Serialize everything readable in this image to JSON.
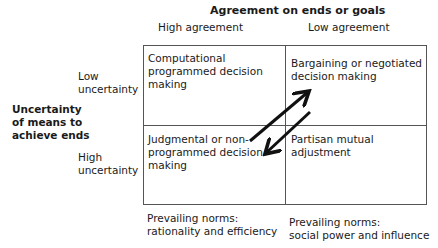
{
  "title": "Agreement on ends or goals",
  "columns": [
    {
      "label": "High agreement"
    },
    {
      "label": "Low agreement"
    }
  ],
  "row_axis_label": [
    "Uncertainty",
    "of means to",
    "achieve ends"
  ],
  "rows": [
    {
      "label": [
        "Low",
        "uncertainty"
      ]
    },
    {
      "label": [
        "High",
        "uncertainty"
      ]
    }
  ],
  "cells": {
    "top_left": [
      "Computational",
      "programmed decision",
      "making"
    ],
    "top_right": [
      "Bargaining or negotiated",
      "decision making"
    ],
    "bottom_left": [
      "Judgmental or non-",
      "programmed decision",
      "making"
    ],
    "bottom_right": [
      "Partisan mutual",
      "adjustment"
    ]
  },
  "norms": {
    "left": [
      "Prevailing norms:",
      "rationality and efficiency"
    ],
    "right": [
      "Prevailing norms:",
      "social power and influence"
    ]
  },
  "arrows": [
    {
      "name": "to-bargaining",
      "direction": "up-right"
    },
    {
      "name": "to-judgmental",
      "direction": "down-left"
    }
  ],
  "colors": {
    "line": "#555555",
    "arrow": "#111111",
    "text": "#1a1a1a"
  }
}
